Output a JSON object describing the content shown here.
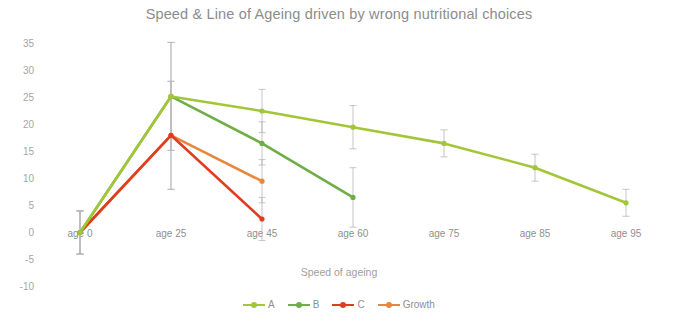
{
  "chart_data": {
    "type": "line",
    "title": "Speed & Line of Ageing driven by wrong nutritional choices",
    "xlabel": "Speed of ageing",
    "ylabel": "",
    "categories": [
      "age 0",
      "age 25",
      "age 45",
      "age 60",
      "age 75",
      "age 85",
      "age 95"
    ],
    "yticks": [
      "35",
      "30",
      "25",
      "20",
      "15",
      "10",
      "5",
      "0",
      "-5",
      "-10"
    ],
    "ylim": [
      -10,
      35
    ],
    "grid": false,
    "legend_position": "bottom",
    "error_bars": true,
    "series": [
      {
        "name": "A",
        "color": "#A3C639",
        "values": [
          0,
          25.2,
          22.5,
          19.5,
          16.5,
          12.0,
          5.5
        ],
        "err": [
          4.0,
          10.0,
          4.0,
          4.0,
          2.5,
          2.5,
          2.5
        ]
      },
      {
        "name": "B",
        "color": "#6FAD46",
        "values": [
          0,
          25.2,
          16.5,
          6.5,
          null,
          null,
          null
        ],
        "err": [
          4.0,
          10.0,
          4.0,
          5.5,
          null,
          null,
          null
        ]
      },
      {
        "name": "C",
        "color": "#E03C1F",
        "values": [
          0,
          18.0,
          2.5,
          null,
          null,
          null,
          null
        ],
        "err": [
          4.0,
          10.0,
          4.0,
          null,
          null,
          null,
          null
        ]
      },
      {
        "name": "Growth",
        "color": "#E8883A",
        "values": [
          0,
          18.0,
          9.5,
          null,
          null,
          null,
          null
        ],
        "err": [
          4.0,
          10.0,
          4.0,
          null,
          null,
          null,
          null
        ]
      }
    ]
  },
  "legend": {
    "items": [
      {
        "label": "A",
        "color": "#A3C639"
      },
      {
        "label": "B",
        "color": "#6FAD46"
      },
      {
        "label": "C",
        "color": "#E03C1F"
      },
      {
        "label": "Growth",
        "color": "#E8883A"
      }
    ]
  }
}
